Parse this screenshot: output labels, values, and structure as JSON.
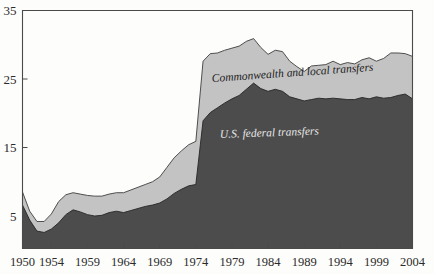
{
  "chart_data": {
    "type": "area",
    "stacked": true,
    "title": "",
    "subtitle": "",
    "xlabel": "",
    "ylabel": "",
    "xlim": [
      1950,
      2004
    ],
    "ylim": [
      0,
      35
    ],
    "grid": false,
    "legend_position": "inline-annotations",
    "x_tick_labels": [
      "1950",
      "1954",
      "1959",
      "1964",
      "1969",
      "1974",
      "1979",
      "1984",
      "1989",
      "1994",
      "1999",
      "2004"
    ],
    "x_tick_values": [
      1950,
      1954,
      1959,
      1964,
      1969,
      1974,
      1979,
      1984,
      1989,
      1994,
      1999,
      2004
    ],
    "y_tick_labels": [
      "35",
      "25",
      "15",
      "5"
    ],
    "y_tick_values": [
      35,
      25,
      15,
      5
    ],
    "x": [
      1950,
      1951,
      1952,
      1953,
      1954,
      1955,
      1956,
      1957,
      1958,
      1959,
      1960,
      1961,
      1962,
      1963,
      1964,
      1965,
      1966,
      1967,
      1968,
      1969,
      1970,
      1971,
      1972,
      1973,
      1974,
      1975,
      1976,
      1977,
      1978,
      1979,
      1980,
      1981,
      1982,
      1983,
      1984,
      1985,
      1986,
      1987,
      1988,
      1989,
      1990,
      1991,
      1992,
      1993,
      1994,
      1995,
      1996,
      1997,
      1998,
      1999,
      2000,
      2001,
      2002,
      2003,
      2004
    ],
    "series": [
      {
        "name": "U.S. federal transfers",
        "color": "#4c4c4c",
        "values": [
          6.6,
          4.4,
          2.8,
          2.6,
          3.1,
          4.0,
          5.2,
          5.9,
          5.6,
          5.2,
          5.0,
          5.1,
          5.5,
          5.7,
          5.5,
          5.8,
          6.1,
          6.4,
          6.6,
          6.9,
          7.5,
          8.3,
          8.9,
          9.4,
          9.6,
          18.9,
          20.1,
          20.8,
          21.5,
          22.1,
          22.6,
          23.5,
          24.4,
          23.6,
          23.2,
          23.5,
          23.2,
          22.4,
          22.1,
          21.8,
          22.0,
          22.2,
          22.1,
          22.2,
          22.1,
          22.0,
          22.0,
          22.3,
          22.1,
          22.4,
          22.2,
          22.3,
          22.6,
          22.8,
          22.1
        ]
      },
      {
        "name": "Commonwealth and local transfers",
        "color": "#c3c3c3",
        "values": [
          1.9,
          1.3,
          1.4,
          1.6,
          2.2,
          3.1,
          2.9,
          2.5,
          2.6,
          2.8,
          2.9,
          2.8,
          2.7,
          2.7,
          2.9,
          3.0,
          3.1,
          3.2,
          3.4,
          3.8,
          4.6,
          5.2,
          5.6,
          6.0,
          6.3,
          8.7,
          8.6,
          8.0,
          7.7,
          7.4,
          7.2,
          7.0,
          6.5,
          6.0,
          5.4,
          5.7,
          5.8,
          5.2,
          4.7,
          4.3,
          4.9,
          4.8,
          5.0,
          5.4,
          5.0,
          5.4,
          5.2,
          5.5,
          6.0,
          5.2,
          5.8,
          6.5,
          6.2,
          5.9,
          6.2
        ]
      }
    ],
    "annotations": [
      {
        "id": "upper-series-label",
        "text": "Commonwealth and local transfers",
        "x_px": 212,
        "y_px": 82,
        "rotation": -4,
        "style": "dark-italic"
      },
      {
        "id": "lower-series-label",
        "text": "U.S. federal transfers",
        "x_px": 220,
        "y_px": 138,
        "rotation": -2,
        "style": "light-italic"
      }
    ],
    "colors": {
      "lower_area": "#4c4c4c",
      "upper_area": "#c3c3c3",
      "axis": "#4a4a4a",
      "background": "#fdfdfb",
      "dark_text": "#1d1d1d",
      "light_text": "#e8e8e8"
    }
  }
}
